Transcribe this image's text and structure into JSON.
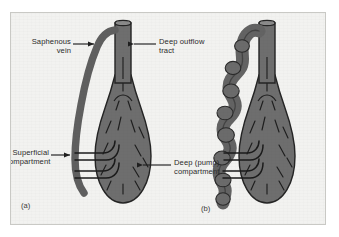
{
  "figure": {
    "title_present": false,
    "background_color": "#f2f2f0",
    "frame_border_color": "#c9c9c5",
    "vessel_fill_color": "#6e6e6e",
    "vessel_outline_color": "#2a2a2a",
    "text_color": "#2b2b2b"
  },
  "labels": {
    "saphenous_vein": "Saphenous\nvein",
    "deep_outflow_tract": "Deep outflow\ntract",
    "superficial_compartment": "Superficial\ncompartment",
    "deep_pump_compartment": "Deep (pump)\ncompartment"
  },
  "panels": [
    {
      "id": "a",
      "caption": "(a)",
      "description": "Normal saphenous vein",
      "vein_type": "straight"
    },
    {
      "id": "b",
      "caption": "(b)",
      "description": "Varicose saphenous vein",
      "vein_type": "tortuous"
    }
  ],
  "icons": {
    "leader_arrow": "arrow-icon"
  }
}
